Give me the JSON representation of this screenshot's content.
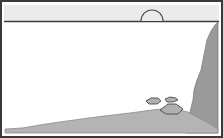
{
  "illustration": {
    "title": "Grayscale landscape line drawing",
    "caption": "",
    "width": 223,
    "height": 138,
    "style": "monochrome line art"
  },
  "colors": {
    "background": "#ffffff",
    "border": "#3a3a3a",
    "header_band": "#ebebeb",
    "header_rule": "#3c3c3c",
    "water": "#ffffff",
    "land_light": "#b4b4b4",
    "land_mid": "#a8a8a8",
    "cliff_dark": "#9a9a9a",
    "outline": "#4a4a4a",
    "rock_fill": "#b0b0b0"
  },
  "frame": {
    "border_label": "outer frame border",
    "border_width": 2,
    "inset_left": 4,
    "inset_top": 4,
    "inset_right": 4,
    "inset_bottom": 4
  },
  "header": {
    "label": "sky band",
    "top": 5,
    "bottom": 21,
    "fill": "#ebebeb",
    "rule_y": 21
  },
  "arch": {
    "label": "semicircular arch",
    "center_x": 152,
    "base_y": 21,
    "radius": 11,
    "stroke": "#4a4a4a",
    "stroke_width": 1.1
  },
  "terrain": {
    "foreground": {
      "label": "sloping shoreline",
      "fill": "#b4b4b4",
      "points": "5,133 5,129 22,128 46,124 74,120 104,116 130,113 152,110 170,108 188,112 205,121 218,129 218,133"
    },
    "cliff": {
      "label": "right cliff headland",
      "fill": "#9a9a9a",
      "points": "218,22 218,133 186,133 186,124 190,112 193,100 194,90 197,80 201,70 203,60 205,50 207,40 211,31 215,25"
    }
  },
  "rocks": [
    {
      "name": "rock-small-left",
      "points": "146,101 151,98 158,98 161,101 157,104 149,104",
      "fill": "#b0b0b0"
    },
    {
      "name": "rock-small-right",
      "points": "165,99 170,97 176,98 178,100 173,102 167,102",
      "fill": "#b0b0b0"
    },
    {
      "name": "rock-large-center",
      "points": "160,110 168,104 176,104 183,109 178,114 166,114",
      "fill": "#b0b0b0"
    }
  ]
}
